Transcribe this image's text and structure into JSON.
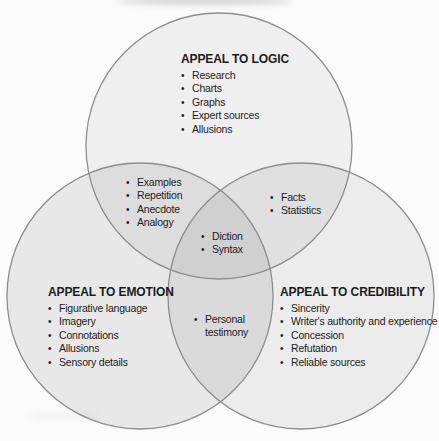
{
  "colors": {
    "background": "#fbfbfb",
    "circle_stroke": "#8d8d8d",
    "text": "#1c1c1c"
  },
  "regions": {
    "logic": {
      "title": "APPEAL TO LOGIC",
      "items": [
        "Research",
        "Charts",
        "Graphs",
        "Expert sources",
        "Allusions"
      ]
    },
    "emotion": {
      "title": "APPEAL TO EMOTION",
      "items": [
        "Figurative language",
        "Imagery",
        "Connotations",
        "Allusions",
        "Sensory details"
      ]
    },
    "credibility": {
      "title": "APPEAL TO CREDIBILITY",
      "items": [
        "Sincerity",
        "Writer's authority and experience",
        "Concession",
        "Refutation",
        "Reliable sources"
      ]
    },
    "logic_emotion": {
      "items": [
        "Examples",
        "Repetition",
        "Anecdote",
        "Analogy"
      ]
    },
    "logic_credibility": {
      "items": [
        "Facts",
        "Statistics"
      ]
    },
    "center": {
      "items": [
        "Diction",
        "Syntax"
      ]
    },
    "emotion_credibility": {
      "items": [
        "Personal testimony"
      ]
    }
  }
}
